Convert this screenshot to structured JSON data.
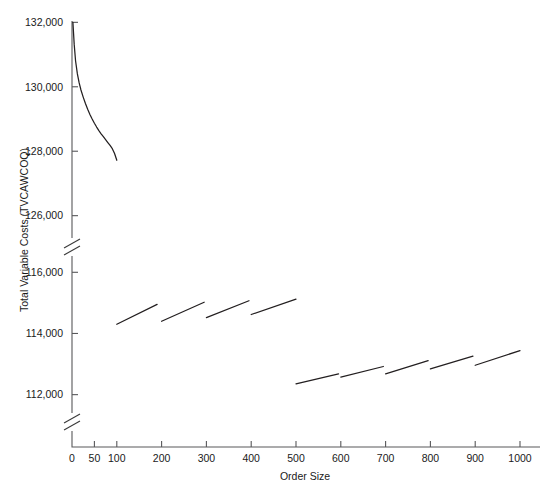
{
  "chart_data": {
    "type": "line",
    "title": "",
    "xlabel": "Order Size",
    "ylabel": "Total Variable Costs (TVCAWCOQ)",
    "xlim": [
      0,
      1040
    ],
    "grid": false,
    "legend": null,
    "axis_breaks": {
      "y_breaks": [
        {
          "between": [
            116500,
            125400
          ],
          "label": "upper-break"
        },
        {
          "between": [
            110600,
            111400
          ],
          "label": "lower-break"
        }
      ],
      "note": "y axis is drawn in three stacked bands separated by double-slash break marks"
    },
    "xticks": [
      0,
      50,
      100,
      200,
      300,
      400,
      500,
      600,
      700,
      800,
      900,
      1000
    ],
    "xtick_labels": [
      "0",
      "50",
      "100",
      "200",
      "300",
      "400",
      "500",
      "600",
      "700",
      "800",
      "900",
      "1000"
    ],
    "yticks": [
      112000,
      114000,
      116000,
      126000,
      128000,
      130000,
      132000
    ],
    "ytick_labels": [
      "112,000",
      "114,000",
      "116,000",
      "126,000",
      "128,000",
      "130,000",
      "132,000"
    ],
    "series": [
      {
        "name": "decaying-cost-curve",
        "kind": "curve",
        "points": [
          [
            2,
            132000
          ],
          [
            5,
            131300
          ],
          [
            8,
            130800
          ],
          [
            12,
            130400
          ],
          [
            16,
            130120
          ],
          [
            20,
            129900
          ],
          [
            25,
            129680
          ],
          [
            30,
            129480
          ],
          [
            35,
            129300
          ],
          [
            40,
            129140
          ],
          [
            45,
            129000
          ],
          [
            50,
            128870
          ],
          [
            55,
            128750
          ],
          [
            60,
            128640
          ],
          [
            65,
            128540
          ],
          [
            70,
            128450
          ],
          [
            75,
            128360
          ],
          [
            80,
            128270
          ],
          [
            85,
            128180
          ],
          [
            90,
            128080
          ],
          [
            95,
            127930
          ],
          [
            100,
            127720
          ]
        ]
      },
      {
        "name": "mid-band-sawtooth-1",
        "kind": "segment",
        "points": [
          [
            100,
            114300
          ],
          [
            190,
            114950
          ]
        ]
      },
      {
        "name": "mid-band-sawtooth-2",
        "kind": "segment",
        "points": [
          [
            200,
            114400
          ],
          [
            295,
            115020
          ]
        ]
      },
      {
        "name": "mid-band-sawtooth-3",
        "kind": "segment",
        "points": [
          [
            300,
            114520
          ],
          [
            395,
            115070
          ]
        ]
      },
      {
        "name": "mid-band-sawtooth-4",
        "kind": "segment",
        "points": [
          [
            400,
            114620
          ],
          [
            500,
            115120
          ]
        ]
      },
      {
        "name": "low-band-sawtooth-1",
        "kind": "segment",
        "points": [
          [
            500,
            112350
          ],
          [
            595,
            112680
          ]
        ]
      },
      {
        "name": "low-band-sawtooth-2",
        "kind": "segment",
        "points": [
          [
            600,
            112570
          ],
          [
            695,
            112920
          ]
        ]
      },
      {
        "name": "low-band-sawtooth-3",
        "kind": "segment",
        "points": [
          [
            700,
            112680
          ],
          [
            795,
            113110
          ]
        ]
      },
      {
        "name": "low-band-sawtooth-4",
        "kind": "segment",
        "points": [
          [
            800,
            112840
          ],
          [
            895,
            113260
          ]
        ]
      },
      {
        "name": "low-band-sawtooth-5",
        "kind": "segment",
        "points": [
          [
            900,
            112960
          ],
          [
            1000,
            113440
          ]
        ]
      }
    ]
  },
  "colors": {
    "data_line": "#231f20",
    "axis": "#58585a",
    "text": "#1a1a1a",
    "background": "#ffffff"
  }
}
